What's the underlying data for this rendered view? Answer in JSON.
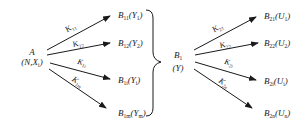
{
  "diagram": {
    "type": "hierarchical-mapping",
    "source_node": {
      "name": "A",
      "params": "(N,X)",
      "param_sub": "i"
    },
    "first_level": {
      "edges": [
        {
          "label": "K",
          "sub": "11",
          "target": "B",
          "target_sub": "11",
          "arg": "Y",
          "arg_sub": "1"
        },
        {
          "label": "K",
          "sub": "12",
          "target": "B",
          "target_sub": "12",
          "arg": "Y",
          "arg_sub": "2"
        },
        {
          "label": "K",
          "sub": "1i",
          "target": "B",
          "target_sub": "1i",
          "arg": "Y",
          "arg_sub": "i"
        },
        {
          "label": "K",
          "sub": "1m",
          "target": "B",
          "target_sub": "1m",
          "arg": "Y",
          "arg_sub": "m"
        }
      ]
    },
    "grouping": {
      "symbol": "right-brace"
    },
    "middle_node": {
      "name": "B",
      "sub": "1",
      "params": "(Y)"
    },
    "second_level": {
      "edges": [
        {
          "label": "K",
          "sub": "21",
          "target": "B",
          "target_sub": "21",
          "arg": "U",
          "arg_sub": "1"
        },
        {
          "label": "K",
          "sub": "22",
          "target": "B",
          "target_sub": "22",
          "arg": "U",
          "arg_sub": "2"
        },
        {
          "label": "K",
          "sub": "2i",
          "target": "B",
          "target_sub": "2i",
          "arg": "U",
          "arg_sub": "i"
        },
        {
          "label": "K",
          "sub": "2n",
          "target": "B",
          "target_sub": "2n",
          "arg": "U",
          "arg_sub": "n"
        }
      ]
    },
    "colors": {
      "stroke": "#1a1a1a",
      "background": "#ffffff"
    }
  }
}
